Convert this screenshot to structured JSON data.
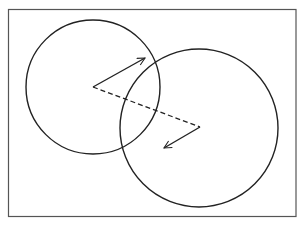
{
  "diagram": {
    "background": "#ffffff",
    "stroke_color": "#222222",
    "frame": {
      "x": 8.5,
      "y": 9.5,
      "width": 287.5,
      "height": 207,
      "stroke": "#555555",
      "stroke_width": 1.2
    },
    "circles": [
      {
        "id": "left-circle",
        "cx": 93,
        "cy": 87,
        "r": 67,
        "stroke_width": 1.4
      },
      {
        "id": "right-circle",
        "cx": 199,
        "cy": 128,
        "r": 79,
        "stroke_width": 1.4
      }
    ],
    "dashed_line": {
      "x1": 93,
      "y1": 87,
      "x2": 200,
      "y2": 127,
      "dash": "5,3",
      "stroke_width": 1.3
    },
    "arrows": [
      {
        "id": "arrow-from-left-center",
        "x1": 93,
        "y1": 87,
        "x2": 145,
        "y2": 58,
        "stroke_width": 1.4
      },
      {
        "id": "arrow-from-right-center",
        "x1": 200,
        "y1": 127,
        "x2": 164,
        "y2": 148,
        "stroke_width": 1.4
      }
    ]
  }
}
